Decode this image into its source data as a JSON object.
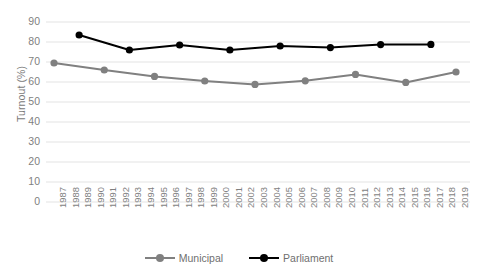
{
  "chart_data": {
    "type": "line",
    "title": "",
    "xlabel": "",
    "ylabel": "Turnout (%)",
    "ylim": [
      0,
      90
    ],
    "ytick_step": 10,
    "yticks": [
      90,
      80,
      70,
      60,
      50,
      40,
      30,
      20,
      10,
      0
    ],
    "grid": true,
    "grid_axis": "y",
    "legend_position": "bottom-center",
    "categories": [
      "1987",
      "1988",
      "1989",
      "1990",
      "1991",
      "1992",
      "1993",
      "1994",
      "1995",
      "1996",
      "1997",
      "1998",
      "1999",
      "2000",
      "2001",
      "2002",
      "2003",
      "2004",
      "2005",
      "2006",
      "2007",
      "2008",
      "2009",
      "2010",
      "2011",
      "2012",
      "2013",
      "2014",
      "2015",
      "2016",
      "2017",
      "2018",
      "2019"
    ],
    "series": [
      {
        "name": "Municipal",
        "color": "#808080",
        "points": [
          {
            "x": "1987",
            "y": 69.5
          },
          {
            "x": "1991",
            "y": 66.0
          },
          {
            "x": "1995",
            "y": 62.8
          },
          {
            "x": "1999",
            "y": 60.5
          },
          {
            "x": "2003",
            "y": 58.8
          },
          {
            "x": "2007",
            "y": 60.6
          },
          {
            "x": "2011",
            "y": 63.8
          },
          {
            "x": "2015",
            "y": 59.8
          },
          {
            "x": "2019",
            "y": 65.0
          }
        ]
      },
      {
        "name": "Parliament",
        "color": "#000000",
        "points": [
          {
            "x": "1989",
            "y": 83.5
          },
          {
            "x": "1993",
            "y": 76.0
          },
          {
            "x": "1997",
            "y": 78.5
          },
          {
            "x": "2001",
            "y": 76.0
          },
          {
            "x": "2005",
            "y": 78.0
          },
          {
            "x": "2009",
            "y": 77.2
          },
          {
            "x": "2013",
            "y": 78.7
          },
          {
            "x": "2017",
            "y": 78.8
          }
        ]
      }
    ]
  },
  "legend": {
    "items": [
      {
        "label": "Municipal"
      },
      {
        "label": "Parliament"
      }
    ]
  }
}
